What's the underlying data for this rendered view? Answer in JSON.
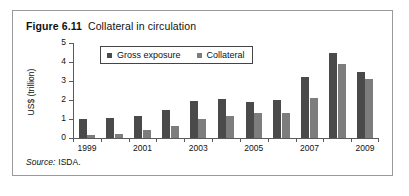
{
  "figure": {
    "number": "Figure 6.11",
    "caption": "Collateral in circulation"
  },
  "source": {
    "keyword": "Source:",
    "value": "ISDA."
  },
  "colors": {
    "series_gross_exposure": "#4a4a4a",
    "series_collateral": "#7d7d7d",
    "axis": "#5a5a5a",
    "frame": "#9a9a9a",
    "text": "#111111"
  },
  "chart_data": {
    "type": "bar",
    "title": "Collateral in circulation",
    "xlabel": "",
    "ylabel": "US$ (trillion)",
    "ylim": [
      0,
      5
    ],
    "yticks": [
      0,
      1,
      2,
      3,
      4,
      5
    ],
    "ytick_labels": [
      "0",
      "1",
      "2",
      "3",
      "4",
      "5"
    ],
    "grid": false,
    "legend_position": "upper-left-inside",
    "categories": [
      "1999",
      "2000",
      "2001",
      "2002",
      "2003",
      "2004",
      "2005",
      "2006",
      "2007",
      "2008",
      "2009"
    ],
    "xtick_labels": [
      "1999",
      "",
      "2001",
      "",
      "2003",
      "",
      "2005",
      "",
      "2007",
      "",
      "2009"
    ],
    "series": [
      {
        "name": "Gross exposure",
        "color": "#4a4a4a",
        "values": [
          1.0,
          1.05,
          1.15,
          1.5,
          1.95,
          2.05,
          1.9,
          2.0,
          3.2,
          4.5,
          3.45
        ]
      },
      {
        "name": "Collateral",
        "color": "#7d7d7d",
        "values": [
          0.15,
          0.2,
          0.4,
          0.65,
          1.0,
          1.15,
          1.3,
          1.3,
          2.1,
          3.9,
          3.1
        ]
      }
    ]
  }
}
